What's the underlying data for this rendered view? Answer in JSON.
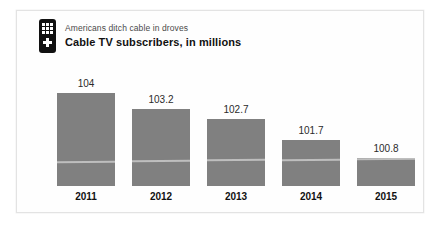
{
  "card": {
    "icon_name": "tv-remote-icon"
  },
  "header": {
    "kicker": "Americans ditch cable in droves",
    "headline": "Cable TV subscribers, in millions"
  },
  "colors": {
    "bar": "#808080",
    "card_background": "#fefefe",
    "card_border": "#e3e3e3",
    "value_text": "#2b2b2b",
    "label_text": "#111111",
    "kicker_text": "#4a4a4a",
    "icon_body": "#111111",
    "icon_keys": "#ffffff"
  },
  "chart_data": {
    "type": "bar",
    "title": "Cable TV subscribers, in millions",
    "subtitle": "Americans ditch cable in droves",
    "xlabel": "",
    "ylabel": "Cable TV subscribers, in millions",
    "categories": [
      "2011",
      "2012",
      "2013",
      "2014",
      "2015"
    ],
    "values": [
      104,
      103.2,
      102.7,
      101.7,
      100.8
    ],
    "value_labels": [
      "104",
      "103.2",
      "102.7",
      "101.7",
      "100.8"
    ],
    "ylim": [
      100,
      104.3
    ],
    "grid": false,
    "legend": null,
    "series": [
      {
        "name": "Cable TV subscribers",
        "values": [
          104,
          103.2,
          102.7,
          101.7,
          100.8
        ]
      }
    ]
  }
}
